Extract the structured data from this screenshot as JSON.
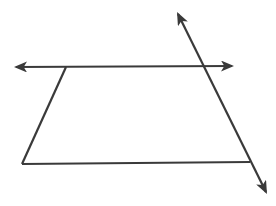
{
  "diagram": {
    "stroke_color": "#3a3a3a",
    "background": "#ffffff",
    "shapes": {
      "trapezoid": {
        "vertices": [
          [
            66,
            67
          ],
          [
            204,
            67
          ],
          [
            250,
            162
          ],
          [
            22,
            164
          ]
        ]
      },
      "horizontal_line": {
        "from": [
          12,
          67
        ],
        "to": [
          236,
          66
        ],
        "arrows": "both"
      },
      "transversal_line": {
        "from": [
          176,
          10
        ],
        "to": [
          268,
          196
        ],
        "arrows": "both"
      }
    }
  }
}
